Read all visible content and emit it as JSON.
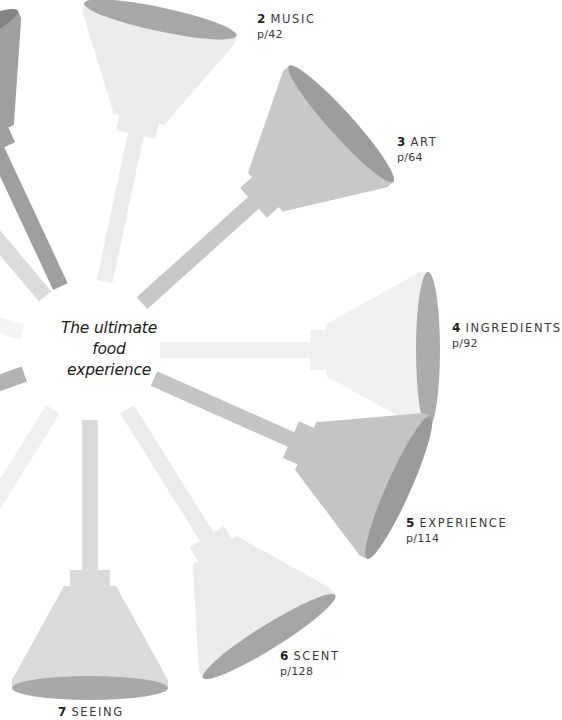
{
  "center": {
    "lines": [
      "The ultimate",
      "food",
      "experience"
    ]
  },
  "chapters": [
    {
      "number": "2",
      "name": "MUSIC",
      "page": "p/42",
      "x": 257,
      "y": 10
    },
    {
      "number": "3",
      "name": "ART",
      "page": "p/64",
      "x": 397,
      "y": 133
    },
    {
      "number": "4",
      "name": "INGREDIENTS",
      "page": "p/92",
      "x": 452,
      "y": 319
    },
    {
      "number": "5",
      "name": "EXPERIENCE",
      "page": "p/114",
      "x": 406,
      "y": 514
    },
    {
      "number": "6",
      "name": "SCENT",
      "page": "p/128",
      "x": 280,
      "y": 647
    },
    {
      "number": "7",
      "name": "SEEING",
      "page": "",
      "x": 58,
      "y": 703
    }
  ],
  "funnels": [
    {
      "id": "funnel-1",
      "angle": -115,
      "tone": "#9a9a9a",
      "mouth": "#7e7e7e",
      "opacity": 0.95
    },
    {
      "id": "funnel-2",
      "angle": -78,
      "tone": "#ececec",
      "mouth": "#a3a3a3",
      "opacity": 0.95
    },
    {
      "id": "funnel-3",
      "angle": -42,
      "tone": "#c8c8c8",
      "mouth": "#9d9d9d",
      "opacity": 1
    },
    {
      "id": "funnel-4",
      "angle": 0,
      "tone": "#f0f0f0",
      "mouth": "#ababab",
      "opacity": 1
    },
    {
      "id": "funnel-5",
      "angle": 24,
      "tone": "#c4c4c4",
      "mouth": "#9b9b9b",
      "opacity": 1
    },
    {
      "id": "funnel-6",
      "angle": 58,
      "tone": "#ebebeb",
      "mouth": "#a5a5a5",
      "opacity": 1
    },
    {
      "id": "funnel-7",
      "angle": 90,
      "tone": "#dadada",
      "mouth": "#a8a8a8",
      "opacity": 1
    },
    {
      "id": "funnel-8",
      "angle": 122,
      "tone": "#ededed",
      "mouth": "#cfcfcf",
      "opacity": 0.8
    },
    {
      "id": "funnel-9",
      "angle": 160,
      "tone": "#aaaaaa",
      "mouth": "#999999",
      "opacity": 0.9
    },
    {
      "id": "funnel-10",
      "angle": 195,
      "tone": "#ededed",
      "mouth": "#dddddd",
      "opacity": 0.6
    },
    {
      "id": "funnel-11",
      "angle": 230,
      "tone": "#d2d2d2",
      "mouth": "#bbbbbb",
      "opacity": 0.8
    }
  ]
}
